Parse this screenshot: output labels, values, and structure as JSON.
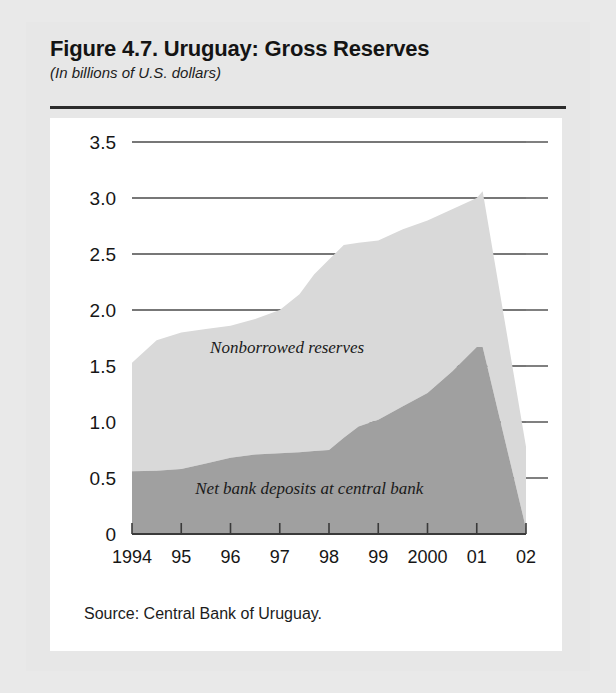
{
  "figure": {
    "title": "Figure 4.7. Uruguay: Gross Reserves",
    "subtitle": "(In billions of U.S. dollars)",
    "source": "Source: Central Bank of Uruguay."
  },
  "colors": {
    "page_background": "#e7e7e7",
    "card_background": "#ffffff",
    "nonborrowed_reserves": "#d9d9d9",
    "net_bank_deposits": "#a0a0a0",
    "grid": "#4a4a4a",
    "axis": "#3a3a3a",
    "text": "#161616"
  },
  "chart_data": {
    "type": "area",
    "stacked": true,
    "title": "Figure 4.7. Uruguay: Gross Reserves",
    "subtitle": "(In billions of U.S. dollars)",
    "xlabel": "",
    "ylabel": "",
    "ylim": [
      0,
      3.5
    ],
    "yticks": [
      0,
      0.5,
      1.0,
      1.5,
      2.0,
      2.5,
      3.0,
      3.5
    ],
    "ytick_labels": [
      "0",
      "0.5",
      "1.0",
      "1.5",
      "2.0",
      "2.5",
      "3.0",
      "3.5"
    ],
    "grid": true,
    "grid_axis": "y",
    "legend": "inline-annotations",
    "categories": [
      "1994",
      "95",
      "96",
      "97",
      "98",
      "99",
      "2000",
      "01",
      "02"
    ],
    "xtick_labels": [
      "1994",
      "95",
      "96",
      "97",
      "98",
      "99",
      "2000",
      "01",
      "02"
    ],
    "x": [
      1994,
      1995,
      1996,
      1997,
      1998,
      1999,
      2000,
      2001,
      2002
    ],
    "series": [
      {
        "name": "Net bank deposits at central bank",
        "color": "#a0a0a0",
        "values": [
          0.56,
          0.58,
          0.68,
          0.72,
          0.75,
          1.02,
          1.26,
          1.67,
          0.05
        ]
      },
      {
        "name": "Nonborrowed reserves",
        "color": "#d9d9d9",
        "values": [
          0.97,
          1.12,
          1.02,
          1.12,
          1.85,
          1.58,
          1.52,
          1.36,
          0.73
        ]
      }
    ],
    "total_series": {
      "name": "Gross reserves (total)",
      "values": [
        1.53,
        1.7,
        1.7,
        1.84,
        2.6,
        2.6,
        2.78,
        3.03,
        0.78
      ]
    },
    "detail_x": [
      1994.0,
      1994.5,
      1995.0,
      1995.5,
      1996.0,
      1996.5,
      1997.0,
      1997.4,
      1997.7,
      1998.0,
      1998.3,
      1998.6,
      1999.0,
      1999.5,
      2000.0,
      2000.5,
      2001.0,
      2001.12,
      2002.0
    ],
    "detail_lower": [
      0.56,
      0.565,
      0.58,
      0.63,
      0.68,
      0.71,
      0.72,
      0.73,
      0.74,
      0.75,
      0.86,
      0.96,
      1.02,
      1.14,
      1.26,
      1.45,
      1.67,
      1.67,
      0.05
    ],
    "detail_total": [
      1.53,
      1.73,
      1.8,
      1.83,
      1.86,
      1.92,
      2.0,
      2.14,
      2.32,
      2.45,
      2.58,
      2.6,
      2.62,
      2.72,
      2.8,
      2.9,
      3.0,
      3.06,
      0.78
    ],
    "annotations": [
      {
        "text": "Nonborrowed reserves",
        "x": 1997.15,
        "y": 1.62
      },
      {
        "text": "Net bank deposits at central bank",
        "x": 1997.6,
        "y": 0.36
      }
    ]
  }
}
